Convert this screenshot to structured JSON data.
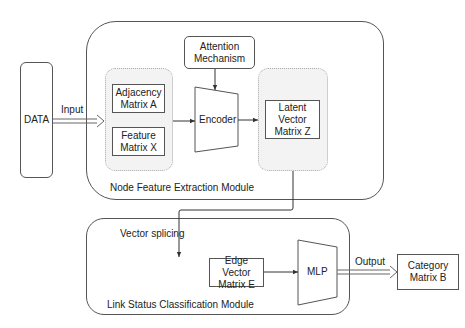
{
  "diagram": {
    "data_node": {
      "label": "DATA"
    },
    "input_edge": {
      "label": "Input"
    },
    "node_feature_module": {
      "title": "Node Feature Extraction Module",
      "attention": {
        "line1": "Attention",
        "line2": "Mechanism"
      },
      "adjacency": {
        "line1": "Adjacency",
        "line2": "Matrix A"
      },
      "feature": {
        "line1": "Feature",
        "line2": "Matrix X"
      },
      "encoder": {
        "label": "Encoder"
      },
      "latent": {
        "line1": "Latent Vector",
        "line2": "Matrix Z"
      }
    },
    "splice_edge": {
      "label": "Vector splicing"
    },
    "link_status_module": {
      "title": "Link Status Classification Module",
      "edge_vector": {
        "line1": "Edge Vector",
        "line2": "Matrix E"
      },
      "mlp": {
        "label": "MLP"
      }
    },
    "output_edge": {
      "label": "Output"
    },
    "category": {
      "line1": "Category",
      "line2": "Matrix B"
    }
  }
}
